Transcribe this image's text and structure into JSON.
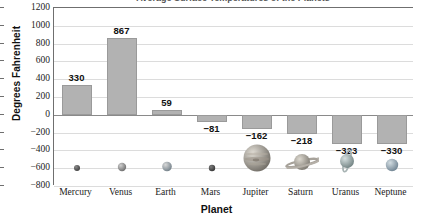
{
  "chart_data": {
    "type": "bar",
    "title": "Average Surface Temperatures of the Planets",
    "xlabel": "Planet",
    "ylabel": "Degrees Fahrenheit",
    "categories": [
      "Mercury",
      "Venus",
      "Earth",
      "Mars",
      "Jupiter",
      "Saturn",
      "Uranus",
      "Neptune"
    ],
    "values": [
      330,
      867,
      59,
      -81,
      -162,
      -218,
      -323,
      -330
    ],
    "value_labels": [
      "330",
      "867",
      "59",
      "−81",
      "−162",
      "−218",
      "−323",
      "−330"
    ],
    "ylim": [
      -800,
      1200
    ],
    "ytick_values": [
      1200,
      1000,
      800,
      600,
      400,
      200,
      0,
      -200,
      -400,
      -600,
      -800
    ],
    "ytick_labels": [
      "1200",
      "1000",
      "800",
      "600",
      "400",
      "200",
      "0",
      "−200",
      "−400",
      "−600",
      "−800"
    ],
    "grid": true,
    "legend": "none",
    "bar_color": "#b2b2b2",
    "bar_border_color": "#9a9a9a",
    "gridline_color": "#dcdcdc",
    "axis_color": "#6f6f6f",
    "planet_icons": [
      "mercury-icon",
      "venus-icon",
      "earth-icon",
      "mars-icon",
      "jupiter-icon",
      "saturn-icon",
      "uranus-icon",
      "neptune-icon"
    ]
  }
}
